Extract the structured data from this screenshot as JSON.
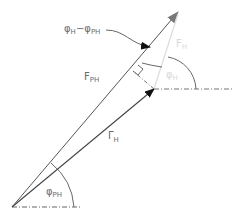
{
  "diagram": {
    "type": "vector phasor diagram",
    "labels": {
      "angle_diff": {
        "main": "φ",
        "sub_a": "H",
        "dash": "−",
        "main2": "φ",
        "sub_b": "PH"
      },
      "f_ph": {
        "main": "F",
        "sub": "PH"
      },
      "gamma_h": {
        "main": "Γ",
        "sub": "H"
      },
      "f_h": {
        "main": "F",
        "sub": "H"
      },
      "phi_h": {
        "main": "φ",
        "sub": "H"
      },
      "phi_ph": {
        "main": "φ",
        "sub": "PH"
      }
    },
    "colors": {
      "line": "#555555",
      "arrow": "#111111",
      "light_vector": "#dcdcdc",
      "dash": "#666666",
      "text": "#6a6a6a",
      "text_light": "#d8d8d8"
    },
    "points": {
      "origin": [
        12,
        207
      ],
      "f_ph_tip": [
        178,
        12
      ],
      "gamma_h_tip": [
        154,
        89
      ],
      "foot_of_perpendicular": [
        133,
        71
      ]
    }
  }
}
